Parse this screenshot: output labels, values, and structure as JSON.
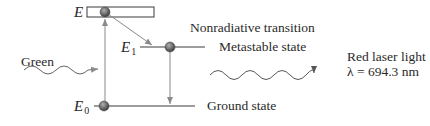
{
  "diagram": {
    "levels": [
      {
        "id": "E",
        "label": "E",
        "subscript": ""
      },
      {
        "id": "E1",
        "label": "E",
        "subscript": "1",
        "state": "Metastable state"
      },
      {
        "id": "E0",
        "label": "E",
        "subscript": "0",
        "state": "Ground state"
      }
    ],
    "labels": {
      "nonradiative": "Nonradiative transition",
      "metastable": "Metastable state",
      "ground": "Ground state",
      "green": "Green",
      "red_line1": "Red laser light",
      "red_line2": "λ = 694.3 nm"
    },
    "colors": {
      "line": "#3a3a3a",
      "arrow": "#8a8a8a",
      "electron": "#6a6a6a"
    }
  }
}
